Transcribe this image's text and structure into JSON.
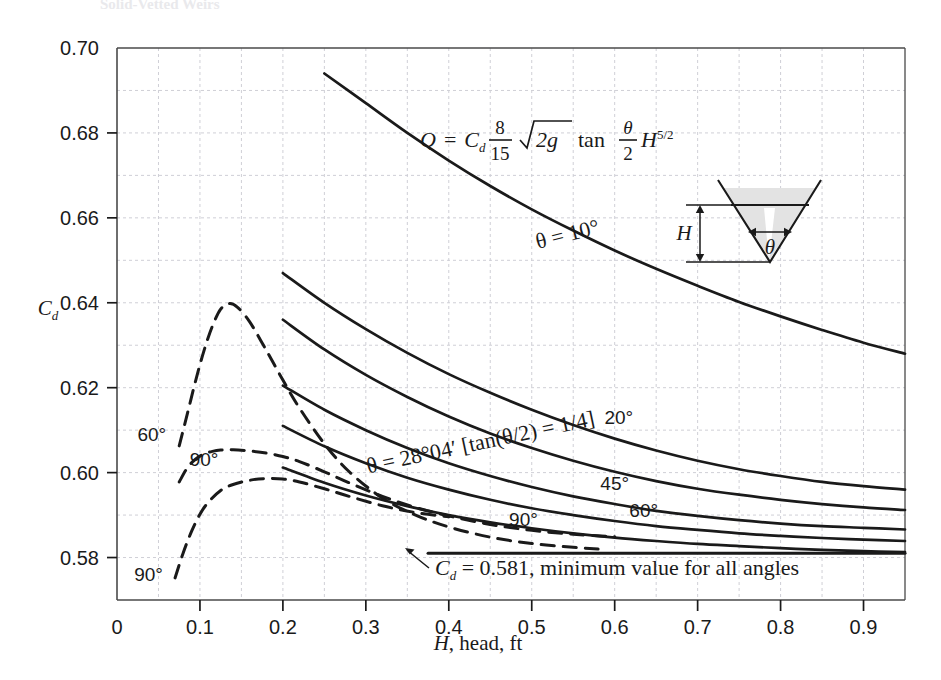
{
  "page": {
    "top_cutoff_text": "Solid-Vetted Weirs"
  },
  "chart_data": {
    "type": "line",
    "title": "",
    "xlabel": "H, head, ft",
    "ylabel": "Cd",
    "xlim": [
      0,
      0.95
    ],
    "ylim": [
      0.57,
      0.7
    ],
    "xticks": [
      "0",
      "0.1",
      "0.2",
      "0.3",
      "0.4",
      "0.5",
      "0.6",
      "0.7",
      "0.8",
      "0.9"
    ],
    "xtick_values": [
      0,
      0.1,
      0.2,
      0.3,
      0.4,
      0.5,
      0.6,
      0.7,
      0.8,
      0.9
    ],
    "yticks": [
      "0.58",
      "0.60",
      "0.62",
      "0.64",
      "0.66",
      "0.68",
      "0.70"
    ],
    "ytick_values": [
      0.58,
      0.6,
      0.62,
      0.64,
      0.66,
      0.68,
      0.7
    ],
    "grid": true,
    "grid_minor_step_y": 0.01,
    "grid_minor_step_x": 0.05,
    "legend_position": "inline-labels",
    "series": [
      {
        "name": "theta = 10 deg",
        "style": "solid",
        "label": "θ = 10°",
        "x": [
          0.25,
          0.3,
          0.35,
          0.4,
          0.45,
          0.5,
          0.55,
          0.6,
          0.65,
          0.7,
          0.75,
          0.8,
          0.85,
          0.9,
          0.95
        ],
        "y": [
          0.694,
          0.687,
          0.68,
          0.6735,
          0.6675,
          0.662,
          0.657,
          0.6523,
          0.648,
          0.644,
          0.6402,
          0.6368,
          0.6336,
          0.6306,
          0.628
        ]
      },
      {
        "name": "theta = 20 deg",
        "style": "solid",
        "label": "20°",
        "x": [
          0.2,
          0.25,
          0.3,
          0.35,
          0.4,
          0.45,
          0.5,
          0.55,
          0.6,
          0.65,
          0.7,
          0.75,
          0.8,
          0.85,
          0.9,
          0.95
        ],
        "y": [
          0.647,
          0.64,
          0.6338,
          0.6282,
          0.6232,
          0.6188,
          0.6148,
          0.6112,
          0.608,
          0.6052,
          0.6028,
          0.6008,
          0.5992,
          0.5978,
          0.5968,
          0.596
        ]
      },
      {
        "name": "theta = 28 deg 04 min",
        "style": "solid",
        "label": "θ = 28°04′ [tan(θ/2) = 1/4]",
        "x": [
          0.2,
          0.25,
          0.3,
          0.35,
          0.4,
          0.45,
          0.5,
          0.55,
          0.6,
          0.65,
          0.7,
          0.75,
          0.8,
          0.85,
          0.9,
          0.95
        ],
        "y": [
          0.636,
          0.629,
          0.623,
          0.6178,
          0.6132,
          0.6092,
          0.6058,
          0.6028,
          0.6002,
          0.598,
          0.5962,
          0.5948,
          0.5936,
          0.5926,
          0.5918,
          0.5912
        ]
      },
      {
        "name": "theta = 45 deg",
        "style": "solid",
        "label": "45°",
        "x": [
          0.2,
          0.25,
          0.3,
          0.35,
          0.4,
          0.45,
          0.5,
          0.55,
          0.6,
          0.65,
          0.7,
          0.75,
          0.8,
          0.85,
          0.9,
          0.95
        ],
        "y": [
          0.6205,
          0.6148,
          0.61,
          0.6058,
          0.6022,
          0.5992,
          0.5966,
          0.5944,
          0.5926,
          0.591,
          0.5898,
          0.5888,
          0.588,
          0.5874,
          0.587,
          0.5866
        ]
      },
      {
        "name": "theta = 60 deg",
        "style": "solid",
        "label": "60°",
        "x": [
          0.2,
          0.25,
          0.3,
          0.35,
          0.4,
          0.45,
          0.5,
          0.55,
          0.6,
          0.65,
          0.7,
          0.75,
          0.8,
          0.85,
          0.9,
          0.95
        ],
        "y": [
          0.611,
          0.6062,
          0.6022,
          0.5988,
          0.596,
          0.5936,
          0.5916,
          0.59,
          0.5886,
          0.5874,
          0.5865,
          0.5857,
          0.5851,
          0.5846,
          0.5842,
          0.5839
        ]
      },
      {
        "name": "theta = 90 deg",
        "style": "solid",
        "label": "90°",
        "x": [
          0.2,
          0.25,
          0.3,
          0.35,
          0.4,
          0.45,
          0.5,
          0.55,
          0.6,
          0.65,
          0.7,
          0.75,
          0.8,
          0.85,
          0.9,
          0.95
        ],
        "y": [
          0.6012,
          0.5976,
          0.5946,
          0.5921,
          0.59,
          0.5883,
          0.5869,
          0.5857,
          0.5847,
          0.5839,
          0.5832,
          0.5827,
          0.5822,
          0.5818,
          0.5815,
          0.5813
        ]
      },
      {
        "name": "theta = 60 deg low-head dashed",
        "style": "dashed",
        "label": "60°",
        "x": [
          0.075,
          0.085,
          0.095,
          0.105,
          0.115,
          0.125,
          0.135,
          0.145,
          0.16,
          0.18,
          0.2,
          0.22,
          0.25,
          0.28,
          0.32,
          0.36,
          0.4,
          0.45,
          0.5,
          0.55,
          0.58
        ],
        "y": [
          0.6063,
          0.614,
          0.6218,
          0.6288,
          0.6345,
          0.6385,
          0.6398,
          0.639,
          0.6355,
          0.6288,
          0.6218,
          0.6152,
          0.6068,
          0.6002,
          0.594,
          0.59,
          0.5872,
          0.5848,
          0.5833,
          0.5824,
          0.582
        ]
      },
      {
        "name": "theta = 90 deg low-head dashed upper",
        "style": "dashed",
        "label": "90°",
        "x": [
          0.075,
          0.085,
          0.095,
          0.105,
          0.115,
          0.125,
          0.14,
          0.16,
          0.18,
          0.2,
          0.22,
          0.25,
          0.28,
          0.32,
          0.36,
          0.4,
          0.45,
          0.5,
          0.55,
          0.6
        ],
        "y": [
          0.5978,
          0.6012,
          0.6032,
          0.6044,
          0.605,
          0.6053,
          0.6054,
          0.6051,
          0.6046,
          0.6038,
          0.6026,
          0.6002,
          0.5976,
          0.5944,
          0.5918,
          0.5898,
          0.5878,
          0.5864,
          0.5855,
          0.5849
        ]
      },
      {
        "name": "theta = 90 deg low-head dashed lower",
        "style": "dashed",
        "label": "90°",
        "x": [
          0.07,
          0.08,
          0.09,
          0.1,
          0.11,
          0.125,
          0.14,
          0.16,
          0.18,
          0.2,
          0.22,
          0.25,
          0.28,
          0.32,
          0.36,
          0.4
        ],
        "y": [
          0.5752,
          0.5812,
          0.5862,
          0.5902,
          0.593,
          0.5958,
          0.5972,
          0.5982,
          0.5986,
          0.5985,
          0.5978,
          0.5962,
          0.5944,
          0.5922,
          0.5906,
          0.5896
        ]
      },
      {
        "name": "minimum-value line",
        "style": "solid-flat",
        "label": "Cd = 0.581, minimum value for all angles",
        "x": [
          0.375,
          0.95
        ],
        "y": [
          0.581,
          0.581
        ]
      }
    ],
    "annotations": {
      "equation": "Q = Cd (8/15) sqrt(2g) tan(θ/2) H^(5/2)",
      "equation_parts": {
        "lhs": "Q",
        "equals": "=",
        "cd": "C",
        "cd_sub": "d",
        "num": "8",
        "den": "15",
        "radicand": "2g",
        "tan": "tan",
        "theta": "θ",
        "two": "2",
        "h": "H",
        "exp": "5/2"
      },
      "min_note": "C",
      "min_note_sub": "d",
      "min_note_rest": " = 0.581, minimum value for all angles",
      "curve_labels": [
        {
          "text": "θ = 10°",
          "x": 0.545,
          "y": 0.6545
        },
        {
          "text": "20°",
          "x": 0.605,
          "y": 0.6115
        },
        {
          "text": "θ = 28°04′ [tan(θ/2) = 1/4]",
          "x": 0.44,
          "y": 0.6055
        },
        {
          "text": "45°",
          "x": 0.6,
          "y": 0.596
        },
        {
          "text": "60°",
          "x": 0.635,
          "y": 0.5895
        },
        {
          "text": "90°",
          "x": 0.49,
          "y": 0.5875
        },
        {
          "text": "60°",
          "x": 0.042,
          "y": 0.6075
        },
        {
          "text": "90°",
          "x": 0.105,
          "y": 0.6015
        },
        {
          "text": "90°",
          "x": 0.038,
          "y": 0.5745
        }
      ]
    },
    "inset": {
      "name": "v-notch-weir-diagram",
      "height_label": "H",
      "angle_label": "θ",
      "fill_color": "#e3e3e3"
    }
  },
  "colors": {
    "ink": "#1a1a1a",
    "grid": "#cfcfd6",
    "axis": "#4a4a4a",
    "inset_fill": "#e3e3e3"
  }
}
